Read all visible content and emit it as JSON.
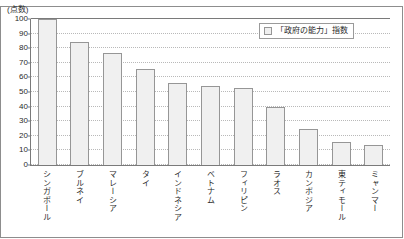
{
  "chart_data": {
    "type": "bar",
    "title": "",
    "subtitle": "",
    "xlabel": "",
    "ylabel": "(点数)",
    "ylim": [
      0,
      100
    ],
    "yticks": [
      0,
      10,
      20,
      30,
      40,
      50,
      60,
      70,
      80,
      90,
      100
    ],
    "grid": true,
    "legend_position": "top-right",
    "categories": [
      "シンガポール",
      "ブルネイ",
      "マレーシア",
      "タイ",
      "インドネシア",
      "ベトナム",
      "フィリピン",
      "ラオス",
      "カンボジア",
      "東ティモール",
      "ミャンマー"
    ],
    "series": [
      {
        "name": "「政府の能力」指数",
        "values": [
          100,
          84,
          77,
          66,
          56,
          54,
          53,
          40,
          25,
          16,
          14
        ]
      }
    ]
  },
  "legend": {
    "entries": [
      {
        "label": "「政府の能力」指数",
        "swatch_icon": "legend-square-icon",
        "color": "#f0f0f0"
      }
    ]
  },
  "colors": {
    "bar_fill": "#f0f0f0",
    "bar_stroke": "#969696",
    "axis": "#7a7a7a",
    "grid": "#b9b9b9",
    "text": "#2b2b2b",
    "frame": "#8d8d8d",
    "background": "#ffffff"
  }
}
